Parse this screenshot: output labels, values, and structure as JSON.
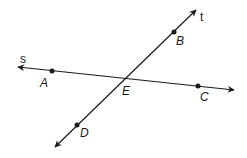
{
  "diagram": {
    "type": "intersecting-lines",
    "colors": {
      "stroke": "#1a1a1a",
      "background": "#ffffff"
    },
    "lines": [
      {
        "name": "s",
        "label": "s",
        "start": [
          18,
          67
        ],
        "end": [
          234,
          90
        ],
        "arrows": "both",
        "label_pos": [
          20,
          63
        ]
      },
      {
        "name": "t",
        "label": "t",
        "start": [
          55,
          147
        ],
        "end": [
          196,
          10
        ],
        "arrows": "both",
        "label_pos": [
          200,
          21
        ]
      }
    ],
    "points": [
      {
        "name": "A",
        "label": "A",
        "pos": [
          52,
          71
        ],
        "on_line": "s",
        "label_pos": [
          40,
          87
        ],
        "marked": true
      },
      {
        "name": "B",
        "label": "B",
        "pos": [
          174,
          32
        ],
        "on_line": "t",
        "label_pos": [
          176,
          45
        ],
        "marked": true
      },
      {
        "name": "C",
        "label": "C",
        "pos": [
          198,
          86
        ],
        "on_line": "s",
        "label_pos": [
          200,
          101
        ],
        "marked": true
      },
      {
        "name": "D",
        "label": "D",
        "pos": [
          77,
          125
        ],
        "on_line": "t",
        "label_pos": [
          80,
          137
        ],
        "marked": true
      },
      {
        "name": "E",
        "label": "E",
        "pos": [
          125,
          79
        ],
        "on_line": "s,t",
        "label_pos": [
          122,
          95
        ],
        "marked": false
      }
    ]
  }
}
